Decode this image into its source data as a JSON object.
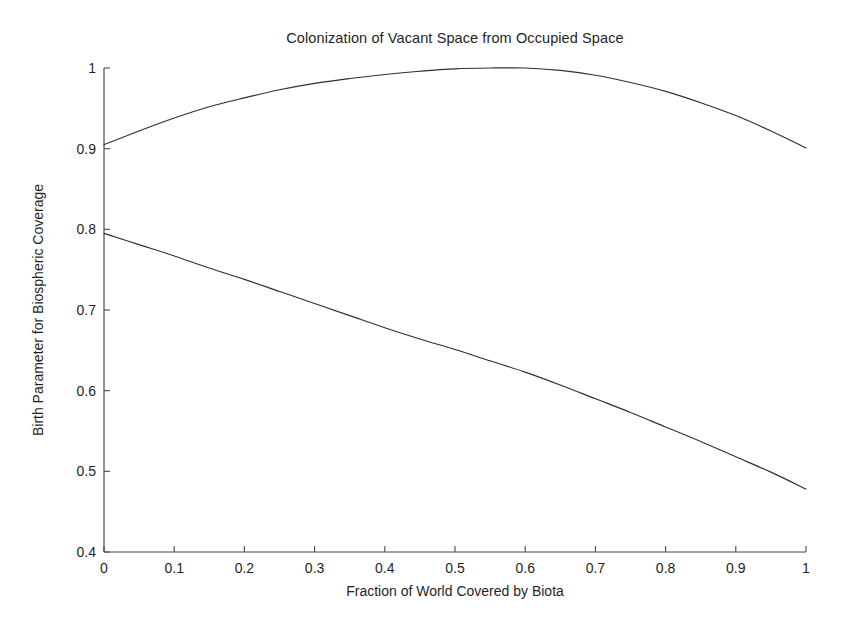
{
  "chart_data": {
    "type": "line",
    "title": "Colonization of Vacant Space from Occupied Space",
    "xlabel": "Fraction of World Covered by Biota",
    "ylabel": "Birth Parameter for Biospheric Coverage",
    "xlim": [
      0,
      1
    ],
    "ylim": [
      0.4,
      1
    ],
    "grid": false,
    "legend": "none",
    "xticks": [
      "0",
      "0.1",
      "0.2",
      "0.3",
      "0.4",
      "0.5",
      "0.6",
      "0.7",
      "0.8",
      "0.9",
      "1"
    ],
    "xtick_values": [
      0,
      0.1,
      0.2,
      0.3,
      0.4,
      0.5,
      0.6,
      0.7,
      0.8,
      0.9,
      1
    ],
    "yticks": [
      "0.4",
      "0.5",
      "0.6",
      "0.7",
      "0.8",
      "0.9",
      "1"
    ],
    "ytick_values": [
      0.4,
      0.5,
      0.6,
      0.7,
      0.8,
      0.9,
      1
    ],
    "x": [
      0,
      0.05,
      0.1,
      0.15,
      0.2,
      0.25,
      0.3,
      0.35,
      0.4,
      0.45,
      0.5,
      0.55,
      0.6,
      0.65,
      0.7,
      0.75,
      0.8,
      0.85,
      0.9,
      0.95,
      1
    ],
    "series": [
      {
        "name": "upper-curve",
        "color": "#303030",
        "values": [
          0.905,
          0.922,
          0.938,
          0.952,
          0.963,
          0.973,
          0.981,
          0.987,
          0.992,
          0.996,
          0.999,
          1.0,
          1.0,
          0.997,
          0.991,
          0.982,
          0.971,
          0.957,
          0.941,
          0.922,
          0.901
        ]
      },
      {
        "name": "lower-curve",
        "color": "#303030",
        "values": [
          0.795,
          0.781,
          0.767,
          0.752,
          0.738,
          0.723,
          0.708,
          0.693,
          0.678,
          0.664,
          0.651,
          0.637,
          0.623,
          0.607,
          0.59,
          0.573,
          0.555,
          0.537,
          0.518,
          0.499,
          0.478
        ]
      }
    ],
    "axes_style": {
      "spines": [
        "left",
        "bottom"
      ],
      "tick_direction": "in",
      "axis_color": "#4a4a4a",
      "background": "#ffffff"
    }
  },
  "plot_geometry": {
    "left_px": 104,
    "right_px": 806,
    "top_px": 68,
    "bottom_px": 552
  }
}
